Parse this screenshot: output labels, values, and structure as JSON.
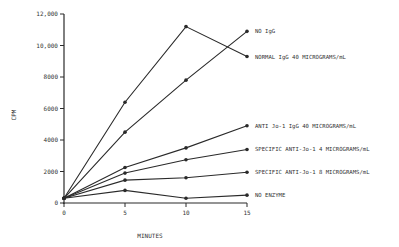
{
  "chart_data": {
    "type": "line",
    "title": "",
    "xlabel": "MINUTES",
    "ylabel": "CPM",
    "x": [
      0,
      5,
      10,
      15
    ],
    "xticks": [
      "0",
      "5",
      "10",
      "15"
    ],
    "yticks": [
      "0",
      "2000",
      "4000",
      "6000",
      "8000",
      "10,000",
      "12,000"
    ],
    "ytick_values": [
      0,
      2000,
      4000,
      6000,
      8000,
      10000,
      12000
    ],
    "xlim": [
      0,
      15
    ],
    "ylim": [
      0,
      12000
    ],
    "grid": false,
    "legend_position": "inline-right",
    "series": [
      {
        "name": "NO IgG",
        "values": [
          300,
          4500,
          7800,
          10900
        ]
      },
      {
        "name": "NORMAL IgG 40 MICROGRAMS/mL",
        "values": [
          300,
          6400,
          11200,
          9300
        ]
      },
      {
        "name": "ANTI Jo-1 IgG 40 MICROGRAMS/mL",
        "values": [
          300,
          2250,
          3500,
          4900
        ]
      },
      {
        "name": "SPECIFIC ANTI-Jo-1 4 MICROGRAMS/mL",
        "values": [
          300,
          1900,
          2750,
          3400
        ]
      },
      {
        "name": "SPECIFIC ANTI-Jo-1 8 MICROGRAMS/mL",
        "values": [
          300,
          1450,
          1600,
          1950
        ]
      },
      {
        "name": "NO ENZYME",
        "values": [
          300,
          800,
          300,
          500
        ]
      }
    ]
  },
  "colors": {
    "line": "#2a2a2a",
    "text": "#333333",
    "background": "#ffffff"
  }
}
